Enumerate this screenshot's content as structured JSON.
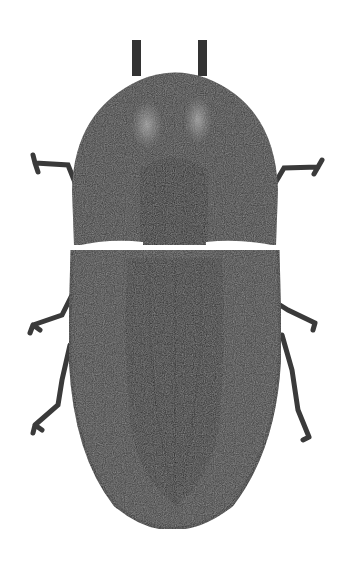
{
  "image": {
    "subject": "beetle illustration (dorsal view)",
    "background_color": "#ffffff",
    "colors": {
      "body_dark": "#2e2e2e",
      "body_mid": "#4a4a4a",
      "highlight": "#8a8a8a",
      "leg": "#3a3a3a",
      "gap": "#ffffff"
    },
    "parts": [
      "antennae",
      "pronotum",
      "elytra",
      "legs"
    ]
  }
}
